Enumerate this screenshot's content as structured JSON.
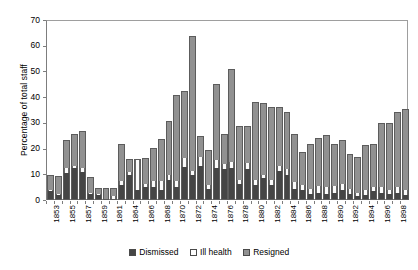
{
  "chart_data": {
    "type": "bar",
    "stacked": true,
    "title": "",
    "xlabel": "",
    "ylabel": "Percentage of total staff",
    "ylim": [
      0,
      70
    ],
    "ytick_labels": [
      "0",
      "10",
      "20",
      "30",
      "40",
      "50",
      "60",
      "70"
    ],
    "ytick_values": [
      0,
      10,
      20,
      30,
      40,
      50,
      60,
      70
    ],
    "grid": false,
    "legend_position": "bottom",
    "legend": [
      "Dismissed",
      "Ill health",
      "Resigned"
    ],
    "colors": {
      "Dismissed": "#454545",
      "Ill health": "#fbfbfb",
      "Resigned": "#919191",
      "axis": "#7d7d7d",
      "plot_background": "#ffffff"
    },
    "categories": [
      "1853",
      "1854",
      "1855",
      "1856",
      "1857",
      "1858",
      "1859",
      "1860",
      "1861",
      "1863",
      "1864",
      "1865",
      "1866",
      "1867",
      "1868",
      "1869",
      "1870",
      "1871",
      "1872",
      "1873",
      "1874",
      "1875",
      "1876",
      "1877",
      "1878",
      "1879",
      "1880",
      "1881",
      "1882",
      "1883",
      "1884",
      "1885",
      "1886",
      "1887",
      "1888",
      "1889",
      "1890",
      "1891",
      "1892",
      "1893",
      "1894",
      "1895",
      "1896",
      "1897",
      "1898",
      "1899"
    ],
    "tick_labels_shown": [
      "1853",
      "1855",
      "1857",
      "1859",
      "1861",
      "1864",
      "1866",
      "1868",
      "1870",
      "1872",
      "1874",
      "1876",
      "1878",
      "1880",
      "1882",
      "1884",
      "1886",
      "1888",
      "1890",
      "1892",
      "1894",
      "1896",
      "1898"
    ],
    "series": [
      {
        "name": "Dismissed",
        "values": [
          3.0,
          1.5,
          10.0,
          12.0,
          10.5,
          2.0,
          1.5,
          0.0,
          0.0,
          5.5,
          9.5,
          3.5,
          4.5,
          4.5,
          3.5,
          7.5,
          4.5,
          12.5,
          9.5,
          13.0,
          4.0,
          12.0,
          11.5,
          12.0,
          6.0,
          11.5,
          5.5,
          8.0,
          5.5,
          11.0,
          9.5,
          4.0,
          3.5,
          2.0,
          2.5,
          2.0,
          2.5,
          3.5,
          2.0,
          1.0,
          1.5,
          3.0,
          2.5,
          2.0,
          2.5,
          1.5
        ]
      },
      {
        "name": "Ill health",
        "values": [
          0.5,
          0.5,
          2.0,
          1.0,
          1.5,
          0.5,
          0.5,
          0.0,
          1.0,
          1.5,
          1.0,
          11.5,
          1.5,
          2.5,
          3.5,
          2.0,
          2.5,
          3.5,
          1.5,
          3.5,
          1.5,
          3.0,
          2.0,
          2.5,
          1.5,
          2.5,
          2.0,
          1.5,
          2.0,
          2.0,
          2.0,
          2.5,
          2.0,
          2.0,
          2.5,
          2.5,
          2.5,
          2.5,
          2.0,
          1.5,
          2.0,
          1.5,
          2.0,
          1.5,
          2.0,
          2.0
        ]
      },
      {
        "name": "Resigned",
        "values": [
          5.5,
          6.5,
          10.5,
          12.0,
          14.0,
          5.5,
          2.0,
          4.0,
          3.0,
          14.0,
          4.5,
          0.0,
          9.5,
          12.5,
          16.0,
          20.5,
          33.0,
          25.5,
          52.0,
          7.5,
          13.0,
          29.5,
          11.5,
          35.5,
          20.5,
          14.0,
          30.0,
          27.5,
          28.0,
          22.5,
          22.0,
          18.5,
          12.5,
          17.0,
          18.5,
          20.0,
          16.0,
          16.5,
          13.0,
          13.5,
          17.0,
          16.5,
          24.5,
          25.5,
          29.0,
          31.0
        ]
      }
    ],
    "totals": [
      9.0,
      8.5,
      22.5,
      25.0,
      26.0,
      8.0,
      4.0,
      4.0,
      4.0,
      21.0,
      15.0,
      15.0,
      15.5,
      19.5,
      23.0,
      30.0,
      40.0,
      41.5,
      63.0,
      24.0,
      18.5,
      44.5,
      25.0,
      50.0,
      28.0,
      28.0,
      37.5,
      37.0,
      35.5,
      35.5,
      33.5,
      25.0,
      18.0,
      21.0,
      23.5,
      24.5,
      21.0,
      22.5,
      17.0,
      16.0,
      20.5,
      21.0,
      29.0,
      29.0,
      33.5,
      34.5
    ]
  }
}
